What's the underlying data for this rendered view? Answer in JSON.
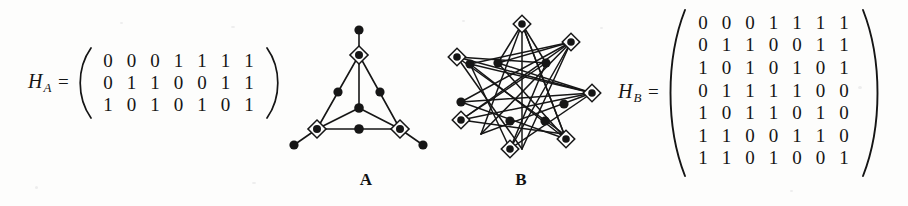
{
  "figure": {
    "background_color": "#fdfdfc",
    "ink_color": "#151515"
  },
  "matrix_a": {
    "name": "H",
    "subscript": "A",
    "equals": "=",
    "rows": 3,
    "cols": 7,
    "values": [
      [
        "0",
        "0",
        "0",
        "1",
        "1",
        "1",
        "1"
      ],
      [
        "0",
        "1",
        "1",
        "0",
        "0",
        "1",
        "1"
      ],
      [
        "1",
        "0",
        "1",
        "0",
        "1",
        "0",
        "1"
      ]
    ]
  },
  "matrix_b": {
    "name": "H",
    "subscript": "B",
    "equals": "=",
    "rows": 7,
    "cols": 7,
    "values": [
      [
        "0",
        "0",
        "0",
        "1",
        "1",
        "1",
        "1"
      ],
      [
        "0",
        "1",
        "1",
        "0",
        "0",
        "1",
        "1"
      ],
      [
        "1",
        "0",
        "1",
        "0",
        "1",
        "0",
        "1"
      ],
      [
        "0",
        "1",
        "1",
        "1",
        "1",
        "0",
        "0"
      ],
      [
        "1",
        "0",
        "1",
        "1",
        "0",
        "1",
        "0"
      ],
      [
        "1",
        "1",
        "0",
        "0",
        "1",
        "1",
        "0"
      ],
      [
        "1",
        "1",
        "0",
        "1",
        "0",
        "0",
        "1"
      ]
    ]
  },
  "graph_a": {
    "caption": "A",
    "diamond_node_count": 3,
    "dot_node_count": 7,
    "description": "triangle drawing with three diamond nodes at the corners and seven dot nodes on and beyond the edges"
  },
  "graph_b": {
    "caption": "B",
    "diamond_node_count": 7,
    "dot_node_count": 7,
    "description": "seven-pointed star drawing with seven diamond nodes on the outer circle and seven dot nodes on the inner circle"
  }
}
